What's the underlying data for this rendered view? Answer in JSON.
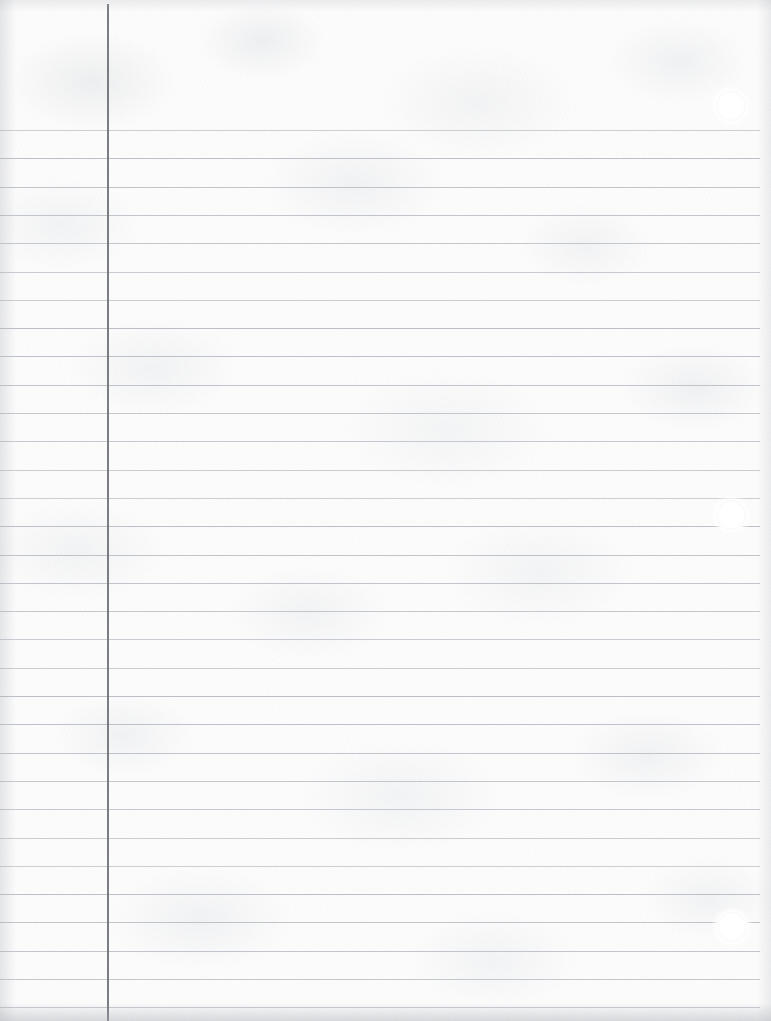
{
  "document": {
    "title": "Ruled Notebook Paper",
    "description": "Blank sheet of college-ruled loose-leaf notebook paper, scanned",
    "content_text": "",
    "page_width": 771,
    "page_height": 1021
  },
  "paper": {
    "background_color": "#fcfcfc",
    "texture": "mottled-scan-grain",
    "edge_shadow_color": "#afb2b8"
  },
  "ruling": {
    "rule_color": "#b9bcc4",
    "rule_count": 32,
    "first_rule_y": 130,
    "rule_spacing": 28.3,
    "rule_left_x": 0,
    "rule_right_x": 760,
    "rule_thickness": 1
  },
  "margin_rule": {
    "label": "left-margin-rule",
    "color": "#6f7278",
    "x": 107,
    "top_y": 4,
    "bottom_y": 1021,
    "thickness": 2
  },
  "hole_punches": [
    {
      "label": "hole-punch-top",
      "cx": 731,
      "cy": 106,
      "r": 15
    },
    {
      "label": "hole-punch-middle",
      "cx": 731,
      "cy": 515,
      "r": 15
    },
    {
      "label": "hole-punch-bottom",
      "cx": 732,
      "cy": 927,
      "r": 15
    }
  ]
}
